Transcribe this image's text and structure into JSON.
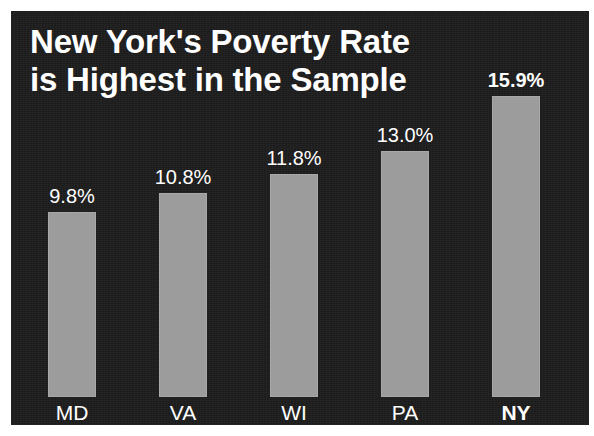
{
  "chart_data": {
    "type": "bar",
    "title": "New York's Poverty Rate\nis Highest in the Sample",
    "categories": [
      "MD",
      "VA",
      "WI",
      "PA",
      "NY"
    ],
    "values": [
      9.8,
      10.8,
      11.8,
      13.0,
      15.9
    ],
    "value_labels": [
      "9.8%",
      "10.8%",
      "11.8%",
      "13.0%",
      "15.9%"
    ],
    "highlighted_category": "NY",
    "xlabel": "",
    "ylabel": "",
    "ylim": [
      0,
      18.5
    ],
    "grid": false,
    "legend": false,
    "units": "percent",
    "colors": {
      "background": "#1c1c1c",
      "bar_fill": "#9c9c9c",
      "text": "#ffffff",
      "page": "#ffffff"
    }
  },
  "title": {
    "text": "New York's Poverty Rate\nis Highest in the Sample"
  },
  "bars": [
    {
      "category": "MD",
      "value": 9.8,
      "label": "9.8%",
      "highlighted": false
    },
    {
      "category": "VA",
      "value": 10.8,
      "label": "10.8%",
      "highlighted": false
    },
    {
      "category": "WI",
      "value": 11.8,
      "label": "11.8%",
      "highlighted": false
    },
    {
      "category": "PA",
      "value": 13.0,
      "label": "13.0%",
      "highlighted": false
    },
    {
      "category": "NY",
      "value": 15.9,
      "label": "15.9%",
      "highlighted": true
    }
  ]
}
